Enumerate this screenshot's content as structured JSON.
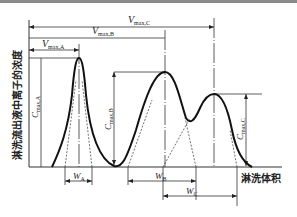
{
  "diagram": {
    "type": "elution-chromatogram",
    "y_axis_label": "淋洗流出液中离子的浓度",
    "x_axis_label": "淋洗体积",
    "peaks": [
      {
        "id": "A",
        "v_label": "V",
        "v_sub": "max,A",
        "c_label": "C",
        "c_sub": "max,A",
        "w_label": "W",
        "w_sub": "A"
      },
      {
        "id": "B",
        "v_label": "V",
        "v_sub": "max,B",
        "c_label": "C",
        "c_sub": "max,B",
        "w_label": "W",
        "w_sub": "B"
      },
      {
        "id": "C",
        "v_label": "V",
        "v_sub": "max,C",
        "c_label": "C",
        "c_sub": "max,C",
        "w_label": "W",
        "w_sub": "C"
      }
    ]
  }
}
